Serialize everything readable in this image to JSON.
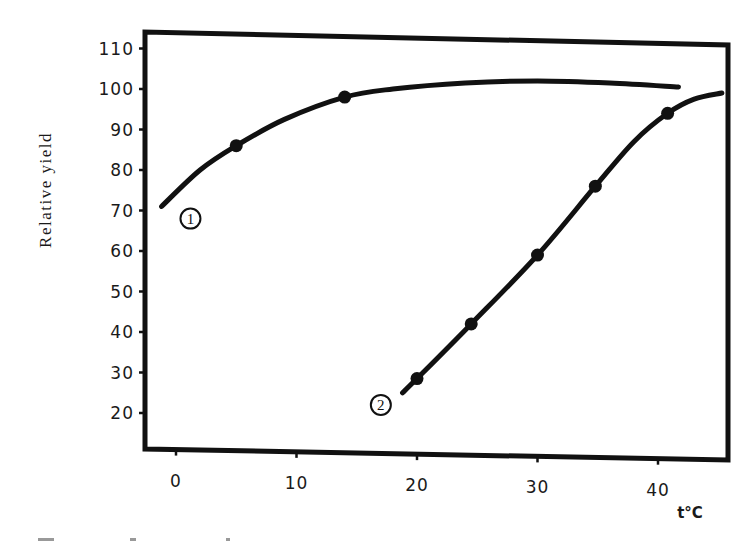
{
  "chart_data": {
    "type": "line",
    "title": "",
    "xlabel": "t°C",
    "ylabel": "Relative yield",
    "xlim": [
      -2,
      46
    ],
    "ylim": [
      12,
      112
    ],
    "xticks": [
      0,
      10,
      20,
      30,
      40
    ],
    "xtick_labels": [
      "0",
      "10",
      "20",
      "30",
      "40"
    ],
    "yticks": [
      20,
      30,
      40,
      50,
      60,
      70,
      80,
      90,
      100,
      110
    ],
    "ytick_labels": [
      "20",
      "30",
      "40",
      "50",
      "60",
      "70",
      "80",
      "90",
      "100",
      "110"
    ],
    "grid": false,
    "legend": "inline circled labels",
    "series": [
      {
        "name": "1",
        "label": "①",
        "markers": [
          {
            "x": 5,
            "y": 86
          },
          {
            "x": 14,
            "y": 98
          }
        ],
        "curve": [
          {
            "x": -1.2,
            "y": 71
          },
          {
            "x": 2,
            "y": 80
          },
          {
            "x": 5,
            "y": 86
          },
          {
            "x": 9,
            "y": 92.5
          },
          {
            "x": 14,
            "y": 98
          },
          {
            "x": 18,
            "y": 100
          },
          {
            "x": 24,
            "y": 101.5
          },
          {
            "x": 30,
            "y": 102
          },
          {
            "x": 36,
            "y": 101.5
          },
          {
            "x": 41.7,
            "y": 100.5
          }
        ],
        "label_pos": {
          "x": 1.2,
          "y": 68
        }
      },
      {
        "name": "2",
        "label": "②",
        "markers": [
          {
            "x": 20,
            "y": 28.5
          },
          {
            "x": 24.5,
            "y": 42
          },
          {
            "x": 30,
            "y": 59
          },
          {
            "x": 34.8,
            "y": 76
          },
          {
            "x": 40.8,
            "y": 94
          }
        ],
        "curve": [
          {
            "x": 18.8,
            "y": 25
          },
          {
            "x": 20,
            "y": 28.5
          },
          {
            "x": 24.5,
            "y": 42
          },
          {
            "x": 30,
            "y": 59
          },
          {
            "x": 34.8,
            "y": 76
          },
          {
            "x": 38,
            "y": 87
          },
          {
            "x": 40.8,
            "y": 94
          },
          {
            "x": 43,
            "y": 97.5
          },
          {
            "x": 45.3,
            "y": 99
          }
        ],
        "label_pos": {
          "x": 17,
          "y": 22
        }
      }
    ]
  },
  "axes": {
    "ylabel": "Relative yield",
    "xunit": "t°C"
  },
  "caption": {
    "visible_text": ""
  }
}
